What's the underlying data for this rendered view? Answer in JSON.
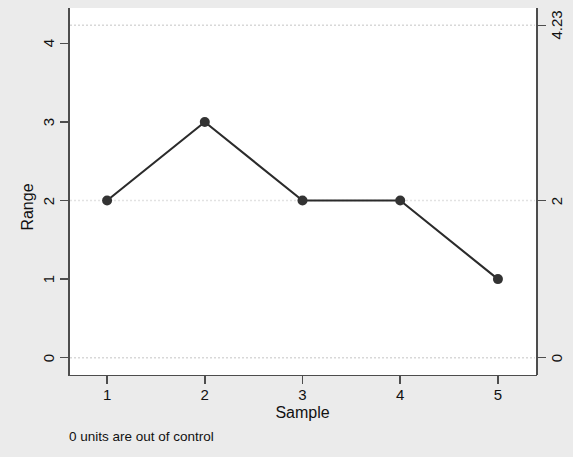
{
  "figure": {
    "background_color": "#ebebeb",
    "plot_background_color": "#ffffff",
    "note": "0 units are out of control"
  },
  "chart_data": {
    "type": "line",
    "title": "",
    "subtitle": "",
    "xlabel": "Sample",
    "ylabel": "Range",
    "x": [
      1,
      2,
      3,
      4,
      5
    ],
    "values": [
      2,
      3,
      2,
      2,
      1
    ],
    "series": [
      {
        "name": "Range",
        "values": [
          2,
          3,
          2,
          2,
          1
        ]
      }
    ],
    "xlim": [
      0.6,
      5.4
    ],
    "ylim": [
      -0.22,
      4.45
    ],
    "xticks": [
      1,
      2,
      3,
      4,
      5
    ],
    "xticklabels": [
      "1",
      "2",
      "3",
      "4",
      "5"
    ],
    "yticks": [
      0,
      1,
      2,
      3,
      4
    ],
    "yticklabels": [
      "0",
      "1",
      "2",
      "3",
      "4"
    ],
    "y2ticks": [
      0,
      2,
      4.23
    ],
    "y2ticklabels": [
      "0",
      "2",
      "4.23"
    ],
    "grid": false,
    "legend": "none",
    "marker": "circle",
    "line_color": "#2b2b2b",
    "marker_color": "#333333",
    "control_limits": [
      {
        "name": "UCL",
        "value": 4.23,
        "label": "4.23",
        "style": "dotted"
      },
      {
        "name": "CL",
        "value": 2,
        "label": "2",
        "style": "dotted"
      },
      {
        "name": "LCL",
        "value": 0,
        "label": "0",
        "style": "dotted"
      }
    ],
    "annotations": [
      "0 units are out of control"
    ]
  },
  "axes": {
    "y_title": "Range",
    "x_title": "Sample",
    "y_left_labels": [
      "4",
      "3",
      "2",
      "1",
      "0"
    ],
    "y_right_labels": [
      "4.23",
      "2",
      "0"
    ],
    "x_labels": [
      "1",
      "2",
      "3",
      "4",
      "5"
    ]
  }
}
